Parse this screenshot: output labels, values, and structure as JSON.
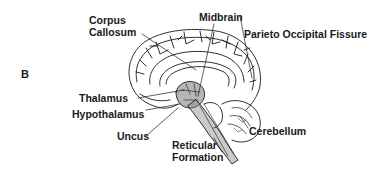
{
  "figure": {
    "panel_letter": "B",
    "colors": {
      "ink": "#1a1a1a",
      "background": "#ffffff",
      "shading": "#6f6f6f"
    }
  },
  "labels": {
    "corpus_callosum_line1": "Corpus",
    "corpus_callosum_line2": "Callosum",
    "midbrain": "Midbrain",
    "parieto_occipital_fissure": "Parieto Occipital Fissure",
    "thalamus": "Thalamus",
    "hypothalamus": "Hypothalamus",
    "uncus": "Uncus",
    "cerebellum": "Cerebellum",
    "reticular_formation_line1": "Reticular",
    "reticular_formation_line2": "Formation"
  }
}
